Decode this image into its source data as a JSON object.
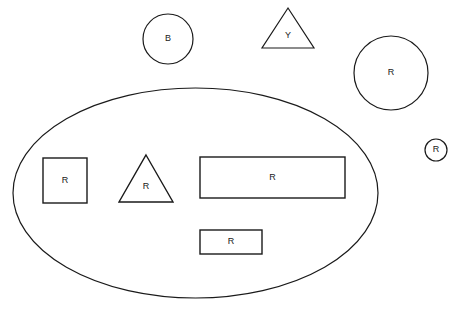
{
  "canvas": {
    "width": 455,
    "height": 312,
    "background_color": "#ffffff",
    "stroke_color": "#1a1a1a",
    "label_color": "#1a1a1a"
  },
  "container": {
    "name": "large-ellipse",
    "shape": "ellipse",
    "label": "",
    "cx": 195.5,
    "cy": 193,
    "rx": 182.5,
    "ry": 105,
    "stroke_width": 1.2
  },
  "shapes_outside": [
    {
      "name": "circle-b",
      "shape": "circle",
      "label": "B",
      "cx": 168,
      "cy": 39,
      "r": 25,
      "stroke_width": 1.2
    },
    {
      "name": "triangle-y",
      "shape": "triangle",
      "label": "Y",
      "cx": 288,
      "cy": 35,
      "half_width": 26,
      "top_y": 8,
      "base_y": 48,
      "stroke_width": 1.2
    },
    {
      "name": "circle-r-large",
      "shape": "circle",
      "label": "R",
      "cx": 391,
      "cy": 73,
      "r": 37,
      "stroke_width": 1.2
    },
    {
      "name": "circle-r-small",
      "shape": "circle",
      "label": "R",
      "cx": 436,
      "cy": 150,
      "r": 11,
      "stroke_width": 1.2
    }
  ],
  "shapes_inside": [
    {
      "name": "square-r",
      "shape": "rect",
      "label": "R",
      "x": 43,
      "y": 158,
      "width": 44,
      "height": 45,
      "stroke_width": 1.4
    },
    {
      "name": "triangle-r",
      "shape": "triangle",
      "label": "R",
      "cx": 146,
      "cy": 183,
      "half_width": 27,
      "top_y": 155,
      "base_y": 202,
      "stroke_width": 1.4
    },
    {
      "name": "rectangle-r-large",
      "shape": "rect",
      "label": "R",
      "x": 200,
      "y": 157,
      "width": 145,
      "height": 41,
      "stroke_width": 1.4
    },
    {
      "name": "rectangle-r-small",
      "shape": "rect",
      "label": "R",
      "x": 200,
      "y": 230,
      "width": 62,
      "height": 24,
      "stroke_width": 1.4
    }
  ]
}
